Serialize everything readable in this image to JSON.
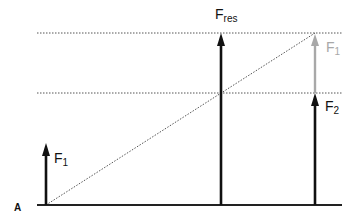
{
  "diagram": {
    "point_label": "A",
    "forces": [
      {
        "id": "F1",
        "label": "F",
        "sub": "1",
        "color": "#111111"
      },
      {
        "id": "Fres",
        "label": "F",
        "sub": "res",
        "color": "#111111"
      },
      {
        "id": "F2",
        "label": "F",
        "sub": "2",
        "color": "#111111"
      },
      {
        "id": "F1_shifted",
        "label": "F",
        "sub": "1",
        "color": "#a8a8a8"
      }
    ],
    "colors": {
      "line": "#111111",
      "dotted": "#555555",
      "ghost": "#a8a8a8",
      "background": "#ffffff"
    }
  }
}
